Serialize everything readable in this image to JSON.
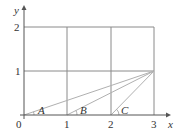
{
  "diagram": {
    "type": "coordinate-grid",
    "x_axis_label": "x",
    "y_axis_label": "y",
    "origin_label": "0",
    "x_ticks": [
      "1",
      "2",
      "3"
    ],
    "y_ticks": [
      "1",
      "2"
    ],
    "target_point": {
      "x": 3,
      "y": 1
    },
    "rays": [
      {
        "from": {
          "x": 0,
          "y": 0
        },
        "to": {
          "x": 3,
          "y": 1
        },
        "angle_label": "A"
      },
      {
        "from": {
          "x": 1,
          "y": 0
        },
        "to": {
          "x": 3,
          "y": 1
        },
        "angle_label": "B"
      },
      {
        "from": {
          "x": 2,
          "y": 0
        },
        "to": {
          "x": 3,
          "y": 1
        },
        "angle_label": "C"
      }
    ],
    "colors": {
      "axis": "#555555",
      "grid": "#888888",
      "ray": "#aaaaaa",
      "text": "#333333"
    }
  },
  "labels": {
    "x": "x",
    "y": "y",
    "origin": "0",
    "xt1": "1",
    "xt2": "2",
    "xt3": "3",
    "yt1": "1",
    "yt2": "2",
    "angleA": "A",
    "angleB": "B",
    "angleC": "C"
  }
}
